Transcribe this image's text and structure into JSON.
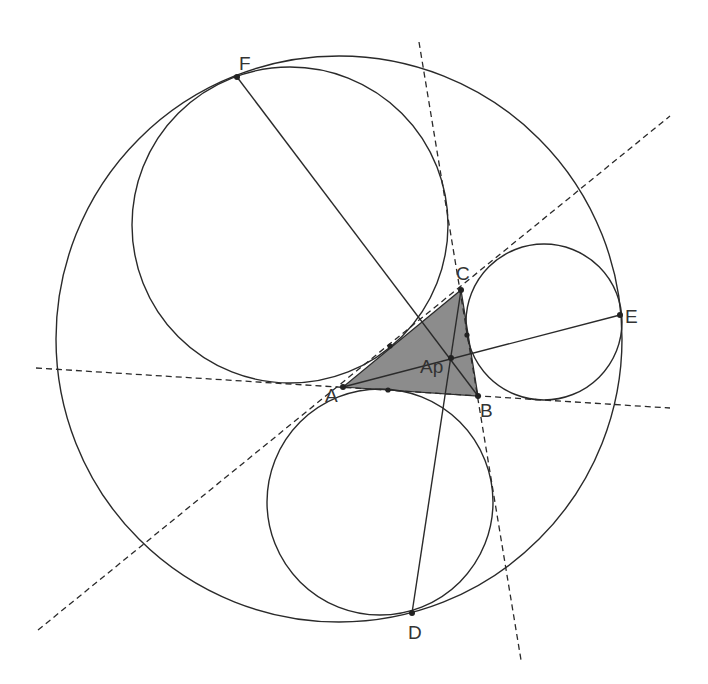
{
  "diagram": {
    "type": "geometry-construction",
    "colors": {
      "stroke": "#2a2a2a",
      "triangle_fill": "#8c8c8c",
      "label": "#333333",
      "background": "#ffffff"
    },
    "points": {
      "A": {
        "label": "A",
        "x": 343,
        "y": 387
      },
      "B": {
        "label": "B",
        "x": 478,
        "y": 396
      },
      "C": {
        "label": "C",
        "x": 461,
        "y": 290
      },
      "Ap": {
        "label": "Ap",
        "x": 451,
        "y": 358
      },
      "D": {
        "label": "D",
        "x": 412,
        "y": 613
      },
      "E": {
        "label": "E",
        "x": 620,
        "y": 315
      },
      "F": {
        "label": "F",
        "x": 237,
        "y": 77
      }
    },
    "tangency_points": [
      {
        "x": 390,
        "y": 346
      },
      {
        "x": 388,
        "y": 390
      },
      {
        "x": 467,
        "y": 335
      }
    ],
    "circles": [
      {
        "name": "outer-circle",
        "cx": 339,
        "cy": 339,
        "r": 283
      },
      {
        "name": "circle-through-F",
        "cx": 290,
        "cy": 225,
        "r": 158
      },
      {
        "name": "circle-through-E",
        "cx": 544,
        "cy": 322,
        "r": 78
      },
      {
        "name": "circle-through-D",
        "cx": 380,
        "cy": 502,
        "r": 113
      }
    ],
    "segments": [
      {
        "name": "segment-A-E",
        "from": "A",
        "to": "E"
      },
      {
        "name": "segment-F-B",
        "from": "F",
        "to": "B"
      },
      {
        "name": "segment-C-D",
        "from": "C",
        "to": "D"
      }
    ],
    "dashed_lines": [
      {
        "name": "line-AB-extended",
        "x1": 36,
        "y1": 368,
        "x2": 670,
        "y2": 408
      },
      {
        "name": "line-BC-extended",
        "x1": 419,
        "y1": 42,
        "x2": 521,
        "y2": 660
      },
      {
        "name": "line-CA-extended",
        "x1": 38,
        "y1": 630,
        "x2": 670,
        "y2": 116
      }
    ],
    "triangle": {
      "name": "triangle-ABC",
      "vertices": [
        "A",
        "B",
        "C"
      ]
    },
    "labels": [
      {
        "text": "F",
        "x": 239,
        "y": 70
      },
      {
        "text": "C",
        "x": 456,
        "y": 280
      },
      {
        "text": "E",
        "x": 625,
        "y": 323
      },
      {
        "text": "Ap",
        "x": 420,
        "y": 373
      },
      {
        "text": "A",
        "x": 325,
        "y": 402
      },
      {
        "text": "B",
        "x": 480,
        "y": 417
      },
      {
        "text": "D",
        "x": 408,
        "y": 639
      }
    ]
  }
}
